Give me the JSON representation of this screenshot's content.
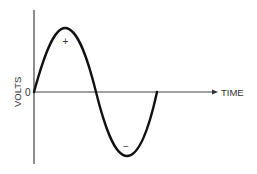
{
  "diagram": {
    "type": "sine-wave",
    "y_axis_label": "VOLTS",
    "x_axis_label": "TIME",
    "origin_label": "0",
    "positive_marker": "+",
    "negative_marker": "−",
    "colors": {
      "line": "#111111",
      "axis": "#444444",
      "text": "#333333"
    }
  }
}
